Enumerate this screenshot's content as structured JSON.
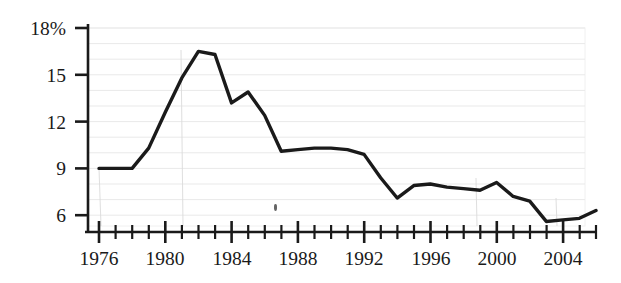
{
  "chart_data": {
    "type": "line",
    "title": "",
    "xlabel": "",
    "ylabel": "",
    "xlim": [
      1976,
      2006
    ],
    "ylim": [
      4.5,
      18
    ],
    "yticks": [
      6,
      9,
      12,
      15,
      18
    ],
    "ytick_labels": [
      "6",
      "9",
      "12",
      "15",
      "18%"
    ],
    "xticks": [
      1976,
      1980,
      1984,
      1988,
      1992,
      1996,
      2000,
      2004
    ],
    "xtick_labels": [
      "1976",
      "1980",
      "1984",
      "1988",
      "1992",
      "1996",
      "2000",
      "2004"
    ],
    "minor_xticks": [
      1977,
      1978,
      1979,
      1981,
      1982,
      1983,
      1985,
      1986,
      1987,
      1989,
      1990,
      1991,
      1993,
      1994,
      1995,
      1997,
      1998,
      1999,
      2001,
      2002,
      2003,
      2005,
      2006
    ],
    "grid": "horizontal-minor-1pct",
    "grid_color": "#e8e8e8",
    "line_color": "#1a1a1a",
    "axis_color": "#1a1a1a",
    "background": "#ffffff",
    "legend": "none",
    "x": [
      1976,
      1977,
      1978,
      1979,
      1980,
      1981,
      1982,
      1983,
      1984,
      1985,
      1986,
      1987,
      1988,
      1989,
      1990,
      1991,
      1992,
      1993,
      1994,
      1995,
      1996,
      1997,
      1998,
      1999,
      2000,
      2001,
      2002,
      2003,
      2004,
      2005,
      2006
    ],
    "values": [
      9.0,
      9.0,
      9.0,
      10.3,
      12.6,
      14.8,
      16.5,
      16.3,
      13.2,
      13.9,
      12.4,
      10.1,
      10.2,
      10.3,
      10.3,
      10.2,
      9.9,
      8.4,
      7.1,
      7.9,
      8.0,
      7.8,
      7.7,
      7.6,
      8.1,
      7.2,
      6.9,
      5.6,
      5.7,
      5.8,
      6.3
    ],
    "series_name": "rate"
  },
  "annotations": {
    "artifact_speck": "ink-speck"
  }
}
